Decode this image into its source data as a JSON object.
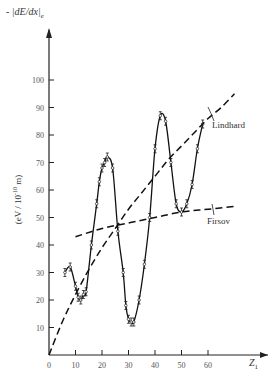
{
  "chart_data": {
    "type": "line",
    "title": "",
    "ylabel_top": "- |dE/dx|e",
    "ylabel": "(eV / 10^-10 m)",
    "xlabel": "Z1",
    "xlim": [
      0,
      80
    ],
    "ylim": [
      0,
      110
    ],
    "x_ticks": [
      0,
      10,
      20,
      30,
      40,
      50,
      60
    ],
    "y_ticks": [
      10,
      20,
      30,
      40,
      50,
      60,
      70,
      80,
      90,
      100
    ],
    "grid": false,
    "series": [
      {
        "name": "Experiment",
        "style": "solid with error bars",
        "x": [
          6,
          8,
          10,
          11,
          12,
          13,
          14,
          16,
          18,
          19,
          20,
          21,
          22,
          24,
          26,
          28,
          29,
          30,
          31,
          32,
          34,
          36,
          38,
          40,
          42,
          44,
          46,
          48,
          50,
          52,
          54,
          56,
          58
        ],
        "y": [
          30,
          32,
          25,
          21,
          20,
          22,
          23,
          40,
          55,
          63,
          68,
          70,
          72,
          68,
          45,
          30,
          18,
          13,
          12,
          12,
          20,
          33,
          50,
          75,
          87,
          85,
          70,
          55,
          52,
          55,
          62,
          75,
          84
        ]
      },
      {
        "name": "Lindhard",
        "style": "dashed",
        "x": [
          0,
          5,
          10,
          15,
          20,
          25,
          30,
          35,
          40,
          45,
          50,
          55,
          60,
          65,
          70
        ],
        "y": [
          0,
          12,
          22,
          31,
          39,
          46,
          53,
          59,
          65,
          71,
          76,
          81,
          86,
          90,
          95
        ]
      },
      {
        "name": "Firsov",
        "style": "dashed",
        "x": [
          10,
          20,
          30,
          40,
          50,
          60,
          70
        ],
        "y": [
          43,
          46,
          48,
          50,
          52,
          53,
          54
        ]
      }
    ],
    "annotations": [
      "Lindhard",
      "Firsov"
    ]
  },
  "labels": {
    "y_top": "- |dE/dx|",
    "y_sub": "e",
    "y_unit": "(eV / 10",
    "y_unit_exp": "-10",
    "y_unit_end": " m)",
    "x_axis": "Z",
    "x_sub": "1",
    "lindhard": "Lindhard",
    "firsov": "Firsov",
    "origin": "0"
  }
}
